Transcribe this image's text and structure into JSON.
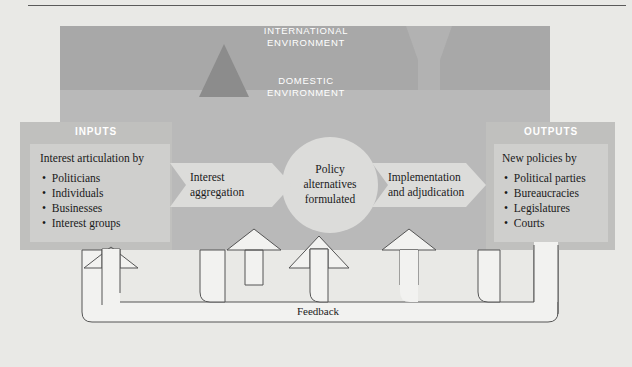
{
  "figure": {
    "name": "policy-process-systems-diagram",
    "top_rule": true
  },
  "environments": {
    "international": {
      "label_line1": "INTERNATIONAL",
      "label_line2": "ENVIRONMENT",
      "color": "#a8a8a8"
    },
    "domestic": {
      "label_line1": "DOMESTIC",
      "label_line2": "ENVIRONMENT",
      "color": "#b9b9b9"
    }
  },
  "inputs": {
    "header": "INPUTS",
    "title": "Interest articulation by",
    "items": [
      "Politicians",
      "Individuals",
      "Businesses",
      "Interest groups"
    ]
  },
  "outputs": {
    "header": "OUTPUTS",
    "title": "New policies by",
    "items": [
      "Political parties",
      "Bureaucracies",
      "Legislatures",
      "Courts"
    ]
  },
  "flows": {
    "aggregation": {
      "line1": "Interest",
      "line2": "aggregation"
    },
    "center": {
      "line1": "Policy",
      "line2": "alternatives",
      "line3": "formulated"
    },
    "implementation": {
      "line1": "Implementation",
      "line2": "and adjudication"
    },
    "feedback": {
      "label": "Feedback"
    }
  },
  "colors": {
    "page_background": "#e9e9e6",
    "international_band": "#a8a8a8",
    "domestic_band": "#b9b9b9",
    "box_fill": "#cfcfcd",
    "panel_fill": "#c6c6c4",
    "light_shape": "#dcdcda",
    "circle_fill": "#dedede",
    "triangle": "#8e8e8e",
    "text": "#1a1a1a",
    "rule": "#555555"
  }
}
